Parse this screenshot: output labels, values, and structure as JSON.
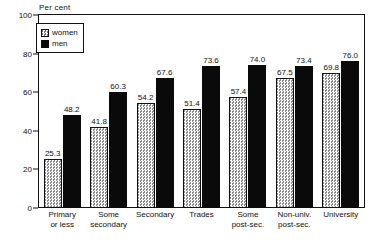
{
  "chart_data": {
    "type": "bar",
    "title": "",
    "subtitle": "",
    "xlabel": "",
    "ylabel": "Per cent",
    "ylim": [
      0,
      100
    ],
    "yticks": [
      0,
      20,
      40,
      60,
      80,
      100
    ],
    "grid": false,
    "legend_position": "top-left",
    "orientation": "vertical",
    "grouping": "grouped",
    "categories": [
      "Primary or less",
      "Some secondary",
      "Secondary",
      "Trades",
      "Some post-sec.",
      "Non-univ. post-sec.",
      "University"
    ],
    "category_lines": [
      [
        "Primary",
        "or less"
      ],
      [
        "Some",
        "secondary"
      ],
      [
        "Secondary",
        ""
      ],
      [
        "Trades",
        ""
      ],
      [
        "Some",
        "post-sec."
      ],
      [
        "Non-univ.",
        "post-sec."
      ],
      [
        "University",
        ""
      ]
    ],
    "series": [
      {
        "name": "women",
        "fill": "dotted-light",
        "color": "#d8d8d8",
        "values": [
          25.3,
          41.8,
          54.2,
          51.4,
          57.4,
          67.5,
          69.8
        ],
        "labels": [
          "25.3",
          "41.8",
          "54.2",
          "51.4",
          "57.4",
          "67.5",
          "69.8"
        ]
      },
      {
        "name": "men",
        "fill": "solid-black",
        "color": "#0a0a0a",
        "values": [
          48.2,
          60.3,
          67.6,
          73.6,
          74.0,
          73.4,
          76.0
        ],
        "labels": [
          "48.2",
          "60.3",
          "67.6",
          "73.6",
          "74.0",
          "73.4",
          "76.0"
        ]
      }
    ]
  },
  "axis": {
    "unit_label": "Per cent",
    "tick_labels": [
      "0",
      "20",
      "40",
      "60",
      "80",
      "100"
    ]
  },
  "legend": {
    "items": [
      {
        "label": "women"
      },
      {
        "label": "men"
      }
    ]
  },
  "colors": {
    "women": "#d8d8d8",
    "men": "#0a0a0a",
    "axis": "#111111",
    "background": "#ffffff"
  }
}
